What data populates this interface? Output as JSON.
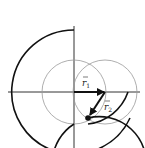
{
  "labels": {
    "r1": "r",
    "r1_sub": "1",
    "r2": "r",
    "r2_sub": "2"
  },
  "colors": {
    "stroke": "#111111",
    "guide": "#999999",
    "axis": "#333333"
  }
}
